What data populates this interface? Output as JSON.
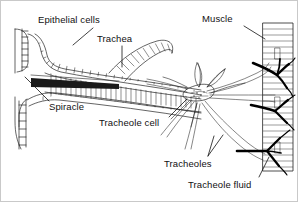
{
  "figure": {
    "background_color": "#ffffff",
    "border_color": "#c9c9c9",
    "ink_color": "#222222",
    "fluid_color": "#000000"
  },
  "labels": [
    {
      "id": "epithelial-cells",
      "text": "Epithelial cells",
      "x": 37,
      "y": 14,
      "leader": {
        "x1": 74,
        "y1": 27,
        "x2": 44,
        "y2": 47
      }
    },
    {
      "id": "trachea",
      "text": "Trachea",
      "x": 95,
      "y": 33,
      "leader": {
        "x1": 121,
        "y1": 45,
        "x2": 121,
        "y2": 68
      }
    },
    {
      "id": "muscle",
      "text": "Muscle",
      "x": 200,
      "y": 14,
      "leader": {
        "x1": 238,
        "y1": 26,
        "x2": 264,
        "y2": 38
      }
    },
    {
      "id": "spiracle",
      "text": "Spiracle",
      "x": 48,
      "y": 104,
      "leader": {
        "x1": 50,
        "y1": 103,
        "x2": 24,
        "y2": 76
      }
    },
    {
      "id": "tracheole-cell",
      "text": "Tracheole cell",
      "x": 98,
      "y": 118,
      "leader": {
        "x1": 168,
        "y1": 118,
        "x2": 188,
        "y2": 98
      }
    },
    {
      "id": "tracheoles",
      "text": "Tracheoles",
      "x": 163,
      "y": 160,
      "leader": {
        "x1": 207,
        "y1": 158,
        "x2": 213,
        "y2": 135
      }
    },
    {
      "id": "tracheole-fluid",
      "text": "Tracheole fluid",
      "x": 188,
      "y": 180,
      "leader": {
        "x1": 258,
        "y1": 178,
        "x2": 268,
        "y2": 158
      }
    }
  ],
  "structures": [
    {
      "id": "spiracle-opening",
      "name": "Spiracle opening (body wall aperture at left)"
    },
    {
      "id": "trachea-tube",
      "name": "Trachea with taenidial rings, tapering rightward"
    },
    {
      "id": "epithelium",
      "name": "Epithelial cell layer lining the trachea"
    },
    {
      "id": "tracheole-cell",
      "name": "Tracheole cell / star cell giving rise to tracheoles"
    },
    {
      "id": "tracheoles",
      "name": "Fine tracheoles radiating toward the muscle"
    },
    {
      "id": "muscle-block",
      "name": "Striated muscle at right edge"
    },
    {
      "id": "tracheole-fluid",
      "name": "Fluid-filled tracheole tips (solid black) inside muscle"
    }
  ]
}
